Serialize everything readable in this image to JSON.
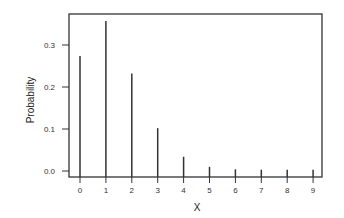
{
  "chart_data": {
    "type": "bar",
    "subtype": "stem",
    "title": "",
    "xlabel": "X",
    "ylabel": "Probability",
    "categories": [
      "0",
      "1",
      "2",
      "3",
      "4",
      "5",
      "6",
      "7",
      "8",
      "9"
    ],
    "values": [
      0.274,
      0.357,
      0.232,
      0.102,
      0.034,
      0.01,
      0.004,
      0.003,
      0.003,
      0.003
    ],
    "ylim": [
      -0.015,
      0.375
    ],
    "yticks": [
      0.0,
      0.1,
      0.2,
      0.3
    ],
    "ytick_labels": [
      "0.0",
      "0.1",
      "0.2",
      "0.3"
    ],
    "grid": false,
    "legend": null
  },
  "colors": {
    "line": "#333333",
    "frame": "#333333",
    "background": "#ffffff"
  }
}
